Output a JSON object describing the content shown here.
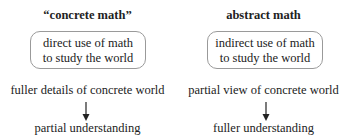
{
  "columns": [
    {
      "title": "“concrete math”",
      "box_lines": [
        "direct use of math",
        "to study the world"
      ],
      "detail": "fuller details of concrete world",
      "result": "partial understanding"
    },
    {
      "title": "abstract math",
      "box_lines": [
        "indirect use of math",
        "to study the world"
      ],
      "detail": "partial view of concrete world",
      "result": "fuller understanding"
    }
  ],
  "colors": {
    "box_border": "#9a9a9a",
    "text": "#222222",
    "arrow": "#222222"
  }
}
